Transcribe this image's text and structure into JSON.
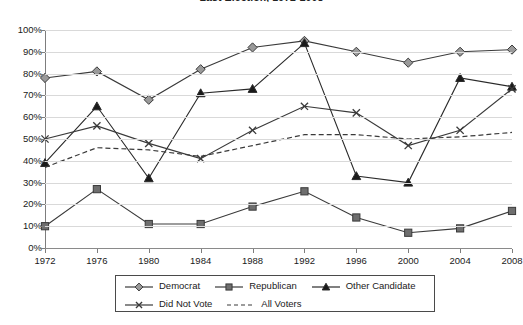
{
  "chart_data": {
    "type": "line",
    "title": "Last Election, 1972-2008",
    "xlabel": "",
    "ylabel": "",
    "ylim": [
      0,
      100
    ],
    "ytick_labels": [
      "100%",
      "90%",
      "80%",
      "70%",
      "60%",
      "50%",
      "40%",
      "30%",
      "20%",
      "10%",
      "0%"
    ],
    "ytick_values": [
      100,
      90,
      80,
      70,
      60,
      50,
      40,
      30,
      20,
      10,
      0
    ],
    "categories": [
      "1972",
      "1976",
      "1980",
      "1984",
      "1988",
      "1992",
      "1996",
      "2000",
      "2004",
      "2008"
    ],
    "x": [
      1972,
      1976,
      1980,
      1984,
      1988,
      1992,
      1996,
      2000,
      2004,
      2008
    ],
    "grid": true,
    "legend_position": "bottom",
    "series": [
      {
        "name": "Democrat",
        "marker": "diamond",
        "line": "solid",
        "color": "#3a3a3a",
        "marker_fill": "#9a9a9a",
        "values": [
          78,
          81,
          68,
          82,
          92,
          95,
          90,
          85,
          90,
          91
        ]
      },
      {
        "name": "Republican",
        "marker": "square",
        "line": "solid",
        "color": "#3a3a3a",
        "marker_fill": "#6e6e6e",
        "values": [
          10,
          27,
          11,
          11,
          19,
          26,
          14,
          7,
          9,
          17
        ]
      },
      {
        "name": "Other Candidate",
        "marker": "triangle",
        "line": "solid",
        "color": "#2a2a2a",
        "marker_fill": "#1a1a1a",
        "values": [
          39,
          65,
          32,
          71,
          73,
          94,
          33,
          30,
          78,
          74
        ]
      },
      {
        "name": "Did Not Vote",
        "marker": "x",
        "line": "solid",
        "color": "#3a3a3a",
        "marker_fill": "#1a1a1a",
        "values": [
          50,
          56,
          48,
          41,
          54,
          65,
          62,
          47,
          54,
          73
        ]
      },
      {
        "name": "All Voters",
        "marker": "none",
        "line": "dashed",
        "color": "#3a3a3a",
        "marker_fill": "none",
        "values": [
          37,
          46,
          45,
          42,
          47,
          52,
          52,
          50,
          51,
          53
        ]
      }
    ]
  },
  "legend": {
    "rows": [
      [
        "Democrat",
        "Republican",
        "Other Candidate"
      ],
      [
        "Did Not Vote",
        "All Voters"
      ]
    ]
  }
}
